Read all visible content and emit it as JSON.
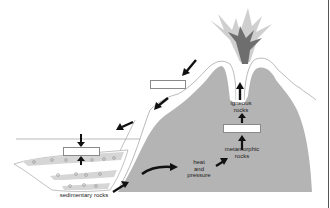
{
  "diagram": {
    "title": "",
    "type": "rock-cycle",
    "labels": {
      "igneous": [
        "igneous",
        "rocks"
      ],
      "metamorphic": [
        "metamorphic",
        "rocks"
      ],
      "heat_pressure": [
        "heat",
        "and",
        "pressure"
      ],
      "sedimentary": "sedimentary rocks"
    },
    "blank_boxes": [
      {
        "id": "blank-weathering",
        "x": 150,
        "y": 80,
        "w": 36,
        "h": 9
      },
      {
        "id": "blank-deposition",
        "x": 63,
        "y": 147,
        "w": 37,
        "h": 9
      },
      {
        "id": "blank-melting",
        "x": 223,
        "y": 124,
        "w": 38,
        "h": 9
      }
    ],
    "colors": {
      "mountain_fill": "#b4b4b4",
      "outline": "#a8a8a8",
      "plume_dark": "#6e6e6e",
      "plume_light": "#c8c8c8",
      "arrow": "#111111",
      "sediment_band": "#d6d6d6",
      "border": "#555555"
    }
  }
}
